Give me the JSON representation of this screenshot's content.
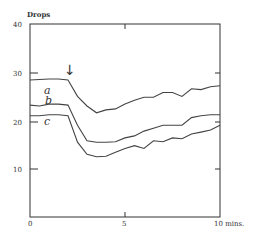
{
  "chart_data": {
    "type": "line",
    "title": "",
    "xlabel": "mins.",
    "ylabel": "Drops",
    "xlim": [
      0,
      10
    ],
    "ylim": [
      0,
      40
    ],
    "x_ticks": [
      0,
      5,
      10
    ],
    "x_tick_labels": [
      "0",
      "5",
      "10 mins."
    ],
    "y_ticks": [
      10,
      20,
      30,
      40
    ],
    "y_tick_labels": [
      "10",
      "20",
      "30",
      "40"
    ],
    "grid": false,
    "legend": "inline curve labels",
    "annotations": [
      {
        "type": "arrow",
        "symbol": "↓",
        "x": 2,
        "note": "marks onset of drop"
      }
    ],
    "x": [
      0,
      0.5,
      1,
      1.5,
      2,
      2.5,
      3,
      3.5,
      4,
      4.5,
      5,
      5.5,
      6,
      6.5,
      7,
      7.5,
      8,
      8.5,
      9,
      9.5,
      10
    ],
    "series": [
      {
        "name": "a",
        "values": [
          28.4,
          28.5,
          28.6,
          28.6,
          28.4,
          25,
          23,
          21.6,
          22.2,
          22.4,
          23.4,
          24.2,
          24.8,
          24.8,
          25.8,
          25.8,
          25,
          26.6,
          26.4,
          27.0,
          27.2
        ]
      },
      {
        "name": "b",
        "values": [
          23.2,
          23.0,
          23.4,
          23.4,
          23.2,
          19,
          15.8,
          15.5,
          15.5,
          15.6,
          16.4,
          16.8,
          17.8,
          18.4,
          19.0,
          19.0,
          19.0,
          20.6,
          21.0,
          21.2,
          21.2
        ]
      },
      {
        "name": "c",
        "values": [
          21.0,
          21.0,
          21.2,
          21.2,
          21.0,
          15.5,
          13.0,
          12.5,
          12.6,
          13.4,
          14.2,
          14.8,
          14.2,
          15.8,
          15.6,
          16.4,
          16.2,
          17.2,
          17.6,
          18.0,
          19.0
        ]
      }
    ]
  },
  "labels": {
    "ylabel": "Drops",
    "y40": "40",
    "y30": "30",
    "y20": "20",
    "y10": "10",
    "x0": "0",
    "x5": "5",
    "x10": "10 mins.",
    "arrow": "↓",
    "curve_a": "a",
    "curve_b": "b",
    "curve_c": "c"
  }
}
